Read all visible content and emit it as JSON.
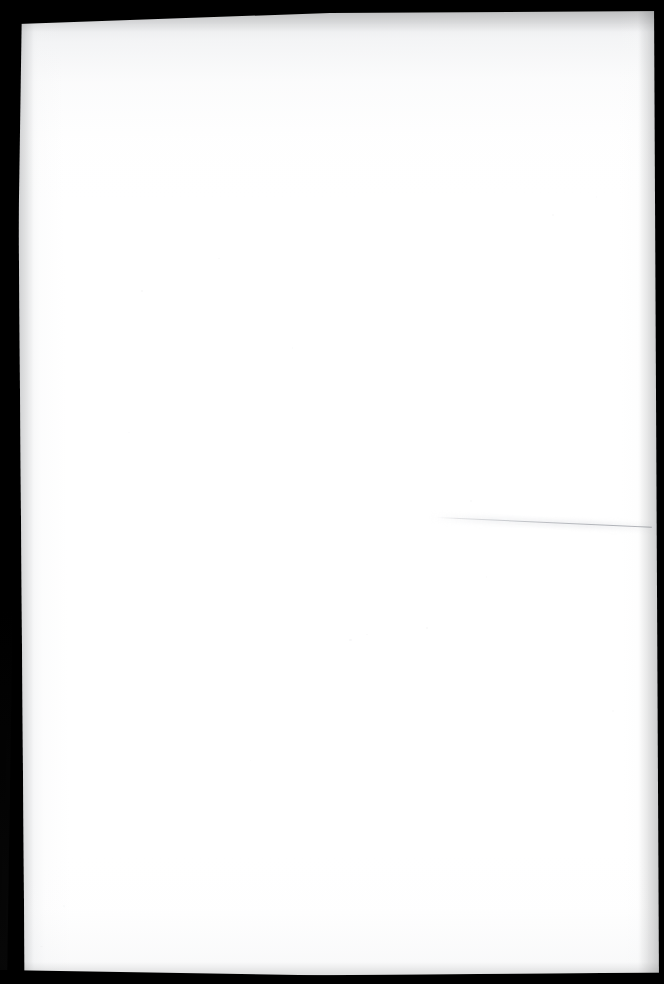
{
  "document": {
    "kind": "scanned-page-image",
    "page_content_type": "blank",
    "visible_text": "",
    "ocr_text": "",
    "notes_label": "",
    "page_number_label": ""
  },
  "canvas": {
    "width_px": 664,
    "height_px": 984
  },
  "page": {
    "paper_color": "#ffffff",
    "backdrop_color": "#000000",
    "left_px": 17,
    "top_px": 9,
    "width_px": 640,
    "height_px": 966,
    "rotation_deg": -0.45
  },
  "scan_artifacts": {
    "top_shadow_color": "#cdcfd2",
    "crease_color": "#b0b3b8",
    "crease_start_x": 437,
    "crease_start_y": 517,
    "crease_length_px": 215,
    "crease_angle_deg": 2.6,
    "edge_band_color": "#000000",
    "left_band_width_px": 22,
    "top_band_height_px": 26,
    "right_band_width_px": 14,
    "bottom_band_height_px": 16
  },
  "specks": [
    {
      "x": 141,
      "y": 290,
      "w": 2,
      "h": 2,
      "opacity": 0.2
    },
    {
      "x": 218,
      "y": 258,
      "w": 2,
      "h": 1,
      "opacity": 0.16
    },
    {
      "x": 292,
      "y": 347,
      "w": 1,
      "h": 2,
      "opacity": 0.14
    },
    {
      "x": 349,
      "y": 639,
      "w": 3,
      "h": 2,
      "opacity": 0.22
    },
    {
      "x": 366,
      "y": 634,
      "w": 2,
      "h": 1,
      "opacity": 0.18
    },
    {
      "x": 426,
      "y": 627,
      "w": 2,
      "h": 2,
      "opacity": 0.2
    },
    {
      "x": 470,
      "y": 500,
      "w": 2,
      "h": 2,
      "opacity": 0.15
    },
    {
      "x": 486,
      "y": 576,
      "w": 1,
      "h": 2,
      "opacity": 0.13
    },
    {
      "x": 128,
      "y": 432,
      "w": 2,
      "h": 1,
      "opacity": 0.12
    },
    {
      "x": 552,
      "y": 214,
      "w": 2,
      "h": 2,
      "opacity": 0.15
    },
    {
      "x": 596,
      "y": 196,
      "w": 1,
      "h": 2,
      "opacity": 0.12
    },
    {
      "x": 63,
      "y": 905,
      "w": 2,
      "h": 2,
      "opacity": 0.14
    },
    {
      "x": 40,
      "y": 946,
      "w": 3,
      "h": 1,
      "opacity": 0.16
    },
    {
      "x": 250,
      "y": 760,
      "w": 1,
      "h": 1,
      "opacity": 0.1
    },
    {
      "x": 612,
      "y": 710,
      "w": 2,
      "h": 2,
      "opacity": 0.13
    }
  ]
}
